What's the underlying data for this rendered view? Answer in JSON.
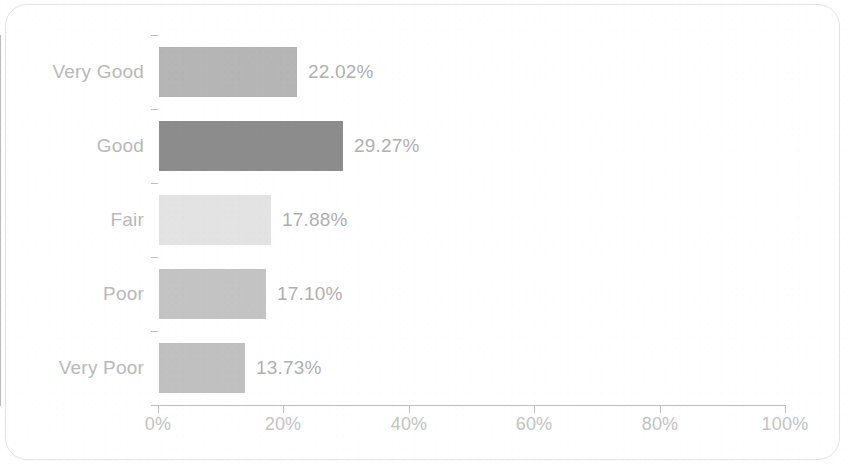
{
  "chart_data": {
    "type": "bar",
    "orientation": "horizontal",
    "title": "",
    "subtitle": "",
    "xlabel": "",
    "ylabel": "",
    "categories": [
      "Very Good",
      "Good",
      "Fair",
      "Poor",
      "Very Poor"
    ],
    "values": [
      22.02,
      29.27,
      17.88,
      17.1,
      13.73
    ],
    "value_labels": [
      "22.02%",
      "29.27%",
      "17.88%",
      "17.10%",
      "13.73%"
    ],
    "bar_colors": [
      "#b5b5b5",
      "#8c8c8c",
      "#e3e3e3",
      "#c3c3c3",
      "#c0c0c0"
    ],
    "xlim": [
      0,
      100
    ],
    "x_ticks": [
      0,
      20,
      40,
      60,
      80,
      100
    ],
    "x_tick_labels": [
      "0%",
      "20%",
      "40%",
      "60%",
      "80%",
      "100%"
    ],
    "grid": false,
    "legend": null,
    "axis_color": "#bebebe",
    "label_color": "#b9b9b9",
    "value_label_color": "#b0b0b0",
    "tick_label_color": "#c3c3c3",
    "background": "#ffffff"
  },
  "figure": {
    "frame_border_color": "#e2e2e2"
  }
}
